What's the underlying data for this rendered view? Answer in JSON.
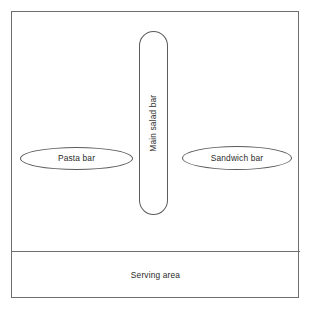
{
  "diagram": {
    "room": {
      "name": "Dining room boundary"
    },
    "stations": [
      {
        "id": "pasta-bar",
        "label": "Pasta bar",
        "shape": "ellipse",
        "orientation": "horizontal"
      },
      {
        "id": "main-salad-bar",
        "label": "Main salad bar",
        "shape": "ellipse",
        "orientation": "vertical",
        "text_rotation": "-90deg"
      },
      {
        "id": "sandwich-bar",
        "label": "Sandwich bar",
        "shape": "ellipse",
        "orientation": "horizontal"
      }
    ],
    "zones": [
      {
        "id": "serving-area",
        "label": "Serving area",
        "shape": "rectangle"
      }
    ],
    "colors": {
      "background": "#ffffff",
      "outline": "#6e6e6e",
      "shape_stroke": "#5c5c5c",
      "text": "#2b2b2b"
    }
  }
}
